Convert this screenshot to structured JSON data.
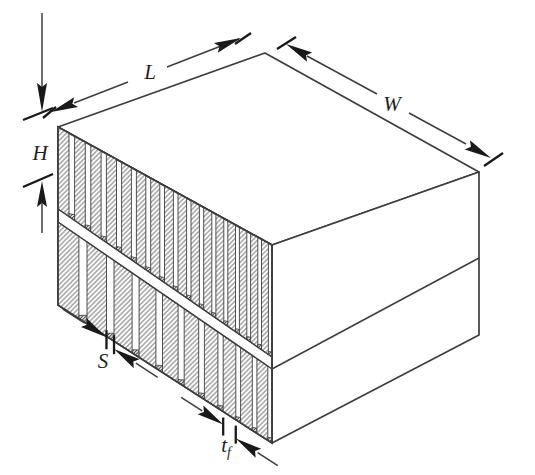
{
  "figure": {
    "kind": "isometric technical line drawing",
    "labels": {
      "length": "L",
      "width": "W",
      "height": "H",
      "fin_spacing": "S",
      "fin_thickness": "t",
      "fin_thickness_subscript": "f"
    },
    "structure": {
      "fin_rows": 2,
      "upper_row_fin_count": 16,
      "lower_row_fin_count": 10
    },
    "colors": {
      "background": "#ffffff",
      "line": "#3d3d3d",
      "arrow": "#191919",
      "hatch": "#7d7d7d",
      "hatch_dark": "#454545"
    }
  }
}
